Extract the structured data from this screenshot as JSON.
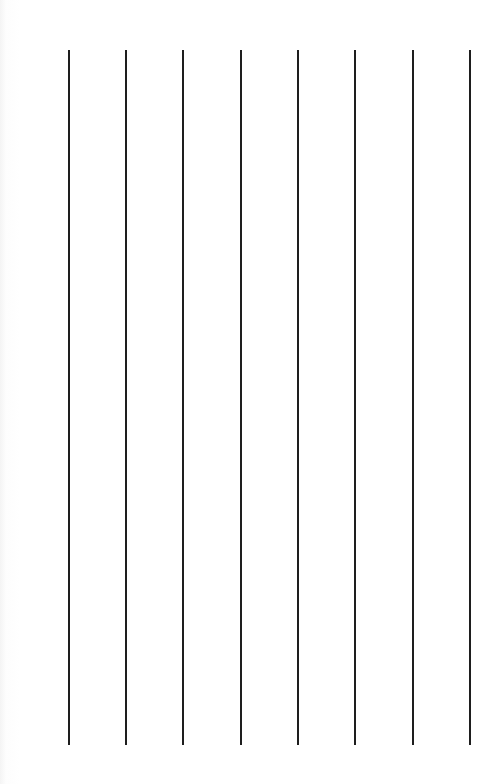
{
  "canvas": {
    "background": "#ffffff",
    "line_color": "#1e1e1e",
    "line_top": 50,
    "line_bottom": 745,
    "line_width": 2
  },
  "lines": [
    {
      "x": 69
    },
    {
      "x": 126
    },
    {
      "x": 183
    },
    {
      "x": 241
    },
    {
      "x": 298
    },
    {
      "x": 355
    },
    {
      "x": 413
    },
    {
      "x": 470
    }
  ]
}
